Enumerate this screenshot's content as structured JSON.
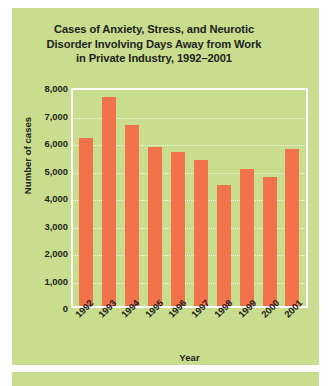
{
  "chart_data": {
    "type": "bar",
    "title": "Cases of Anxiety, Stress, and Neurotic Disorder Involving Days Away from Work in Private Industry, 1992–2001",
    "title_lines": [
      "Cases of Anxiety, Stress, and Neurotic",
      "Disorder Involving Days Away from Work",
      "in Private Industry, 1992–2001"
    ],
    "xlabel": "Year",
    "ylabel": "Number of cases",
    "categories": [
      "1992",
      "1993",
      "1994",
      "1995",
      "1996",
      "1997",
      "1998",
      "1999",
      "2000",
      "2001"
    ],
    "values": [
      6100,
      7600,
      6600,
      5800,
      5600,
      5300,
      4400,
      5000,
      4700,
      5700
    ],
    "ylim": [
      0,
      8000
    ],
    "ytick_values": [
      0,
      1000,
      2000,
      3000,
      4000,
      5000,
      6000,
      7000,
      8000
    ],
    "ytick_labels": [
      "0",
      "1,000",
      "2,000",
      "3,000",
      "4,000",
      "5,000",
      "6,000",
      "7,000",
      "8,000"
    ],
    "grid": true,
    "legend": "none",
    "bar_color": "#f2724c",
    "panel_color": "#c9dd8e",
    "gridline_color": "#f4f8e4",
    "frame_color": "#ffffff",
    "text_color": "#231f20"
  }
}
